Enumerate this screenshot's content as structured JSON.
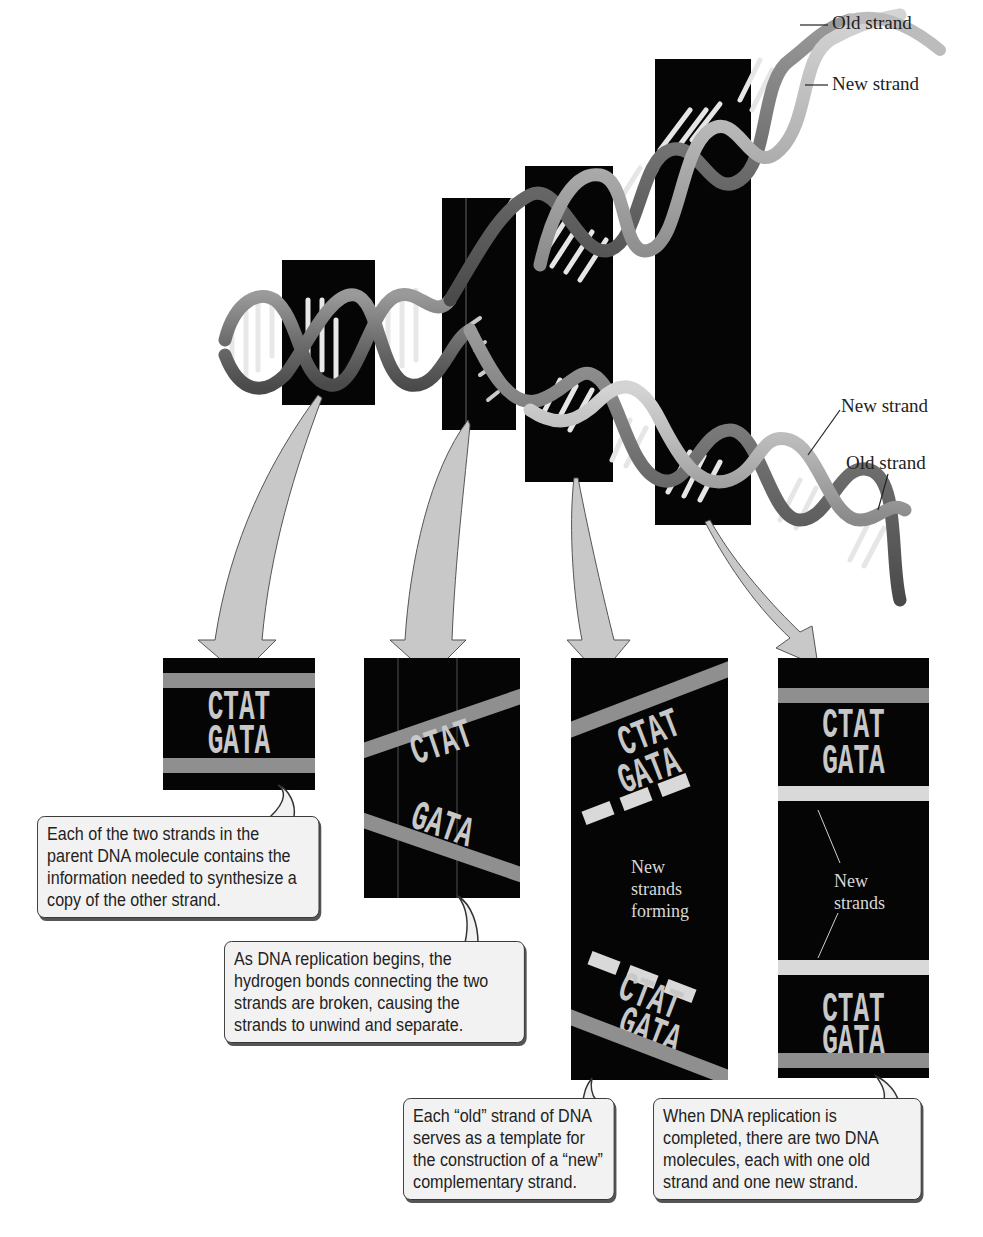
{
  "figure": {
    "type": "DNA semiconservative replication diagram",
    "helix_labels": {
      "top_old": "Old strand",
      "top_new": "New strand",
      "bottom_new": "New strand",
      "bottom_old": "Old strand"
    },
    "colors": {
      "background": "#ffffff",
      "panel": "#050505",
      "old_strand_band": "#8f8f8f",
      "new_strand_band": "#d9d9d9",
      "arrow": "#c8c8c8",
      "callout_fill": "#f2f2f2"
    }
  },
  "panels": [
    {
      "id": "parent",
      "top_sequence": "CTAT",
      "bottom_sequence": "GATA",
      "callout": "Each of the two strands in the parent DNA molecule contains the information needed to synthesize a copy of the other strand."
    },
    {
      "id": "unwinding",
      "top_sequence": "CTAT",
      "bottom_sequence": "GATA",
      "callout": "As DNA replication begins, the hydrogen bonds connecting the two strands are broken, causing the strands to unwind and separate."
    },
    {
      "id": "synthesis",
      "top_sequence": "CTAT",
      "top_new_sequence": "GATA",
      "bottom_new_sequence": "CTAT",
      "bottom_sequence": "GATA",
      "inner_label_lines": [
        "New",
        "strands",
        "forming"
      ],
      "callout": "Each “old” strand of DNA serves as a template for the construction of a “new” complementary strand."
    },
    {
      "id": "completed",
      "top_sequence": "CTAT",
      "top_new_sequence": "GATA",
      "bottom_new_sequence": "CTAT",
      "bottom_sequence": "GATA",
      "inner_label_lines": [
        "New",
        "strands"
      ],
      "callout": "When DNA replication is completed, there are two DNA molecules, each with one old strand and one new strand."
    }
  ]
}
